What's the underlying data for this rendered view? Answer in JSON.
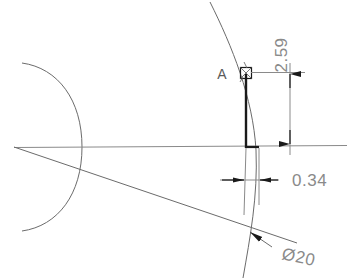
{
  "drawing": {
    "type": "cad-technical-drawing",
    "title": "Detail view of profile edge with dimensions",
    "background_color": "#ffffff",
    "line_color": "#6b6b6b",
    "heavy_line_color": "#1a1a1a",
    "text_color": "#8a8a8a",
    "label_color": "#5a5a5a",
    "width": 347,
    "height": 279,
    "labels": {
      "detail_callout": "A",
      "vertical_dimension": "2.59",
      "horizontal_dimension": "0.34",
      "diameter_dimension": "Ø20"
    },
    "annotations": [
      {
        "name": "detail-callout-a",
        "text": "A",
        "x": 222,
        "y": 79,
        "rotation": 0,
        "description": "Detail callout letter pointing at small square marker"
      },
      {
        "name": "vertical-dimension-value",
        "text": "2.59",
        "x": 287,
        "y": 55,
        "rotation": -90,
        "description": "Vertical distance from point A down to centerline"
      },
      {
        "name": "horizontal-dimension-value",
        "text": "0.34",
        "x": 292,
        "y": 186,
        "rotation": 0,
        "description": "Horizontal width between two profile lines"
      },
      {
        "name": "diameter-dimension-value",
        "text": "Ø20",
        "x": 281,
        "y": 259,
        "rotation": 12,
        "description": "Diameter 20 leader pointing to the arc"
      }
    ],
    "geometry": {
      "centerline_y": 147,
      "heavy_edge_x": 246,
      "detail_square": {
        "x": 246,
        "y": 73,
        "size": 11
      },
      "vertical_dim_line_x": 290,
      "vertical_dim_from_y": 75,
      "vertical_dim_to_y": 143,
      "horizontal_dim_y": 180,
      "horizontal_dim_from_x": 245,
      "horizontal_dim_to_x": 259
    }
  }
}
